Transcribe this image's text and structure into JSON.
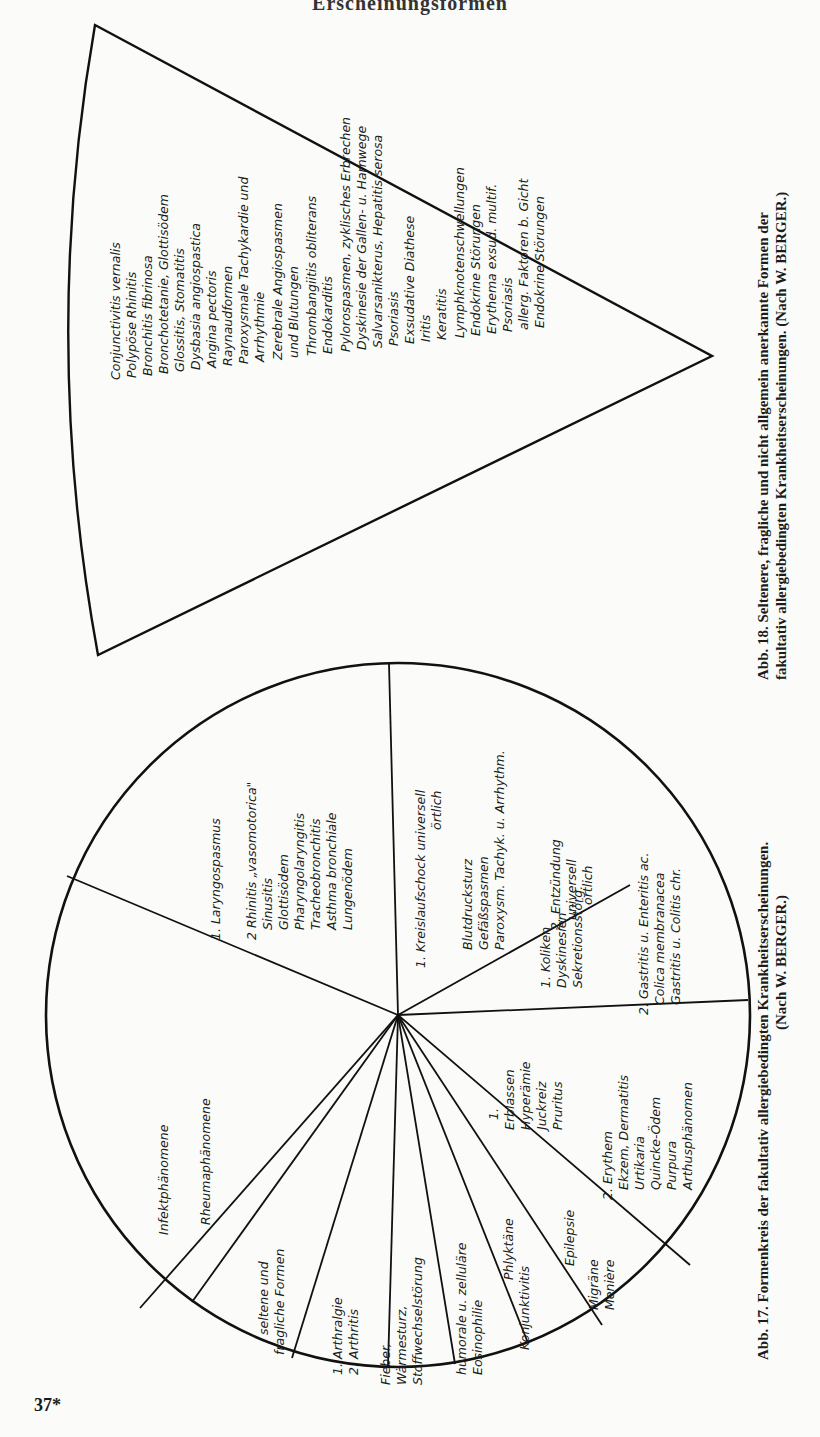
{
  "page": {
    "running_head": "Erscheinungsformen",
    "page_number": "37*"
  },
  "figure17": {
    "caption_line1": "Abb. 17.  Formenkreis der fakultativ allergiebedingten Krankheitserscheinungen.",
    "caption_line2": "(Nach W. BERGER.)",
    "sectors": [
      {
        "id": "respiratory",
        "lines": [
          "1. Laryngospasmus",
          "",
          "2  Rhinitis „vasomotorica\"",
          "Sinusitis",
          "Glottisödem",
          "Pharyngolaryngitis",
          "Tracheobronchitis",
          "Asthma bronchiale",
          "Lungenödem"
        ]
      },
      {
        "id": "circulatory",
        "lines": [
          "1. Kreislaufschock  universell",
          "örtlich",
          "",
          "Blutdrucksturz",
          "Gefäßspasmen",
          "Paroxysm. Tachyk. u. Arrhythm."
        ]
      },
      {
        "id": "inflammation",
        "lines": [
          "2. Entzündung",
          "universell",
          "örtlich"
        ]
      },
      {
        "id": "digestive-1",
        "lines": [
          "1. Koliken",
          "Dyskinesien",
          "Sekretionsstörg."
        ]
      },
      {
        "id": "digestive-2",
        "lines": [
          "2. Gastritis u. Enteritis ac.",
          "Colica membranacea",
          "Gastritis u. Colitis chr."
        ]
      },
      {
        "id": "skin-1",
        "lines": [
          "1.",
          "Erblassen",
          "Hyperämie",
          "Juckreiz",
          "Pruritus"
        ]
      },
      {
        "id": "skin-2",
        "lines": [
          "2. Erythem",
          "Ekzem, Dermatitis",
          "Urtikaria",
          "Quincke-Ödem",
          "Purpura",
          "Arthusphänomen"
        ]
      },
      {
        "id": "neuro",
        "lines": [
          "Migräne",
          "Menière"
        ]
      },
      {
        "id": "epilepsy",
        "lines": [
          "Epilepsie"
        ]
      },
      {
        "id": "eye",
        "lines": [
          "Phlyktäne",
          "Konjunktivitis"
        ]
      },
      {
        "id": "blood",
        "lines": [
          "humorale u. zelluläre",
          "Eosinophilie"
        ]
      },
      {
        "id": "metabolic",
        "lines": [
          "Fieber,",
          "Wärmesturz,",
          "Stoffwechselstörung"
        ]
      },
      {
        "id": "joints",
        "lines": [
          "1. Arthralgie",
          "2. Arthritis"
        ]
      },
      {
        "id": "rare",
        "lines": [
          "seltene und",
          "fragliche Formen"
        ]
      },
      {
        "id": "rheuma-infekt",
        "lines": [
          "Infektphänomene",
          "Rheumaphänomene"
        ]
      }
    ]
  },
  "figure18": {
    "caption_line1": "Abb. 18.  Seltenere, fragliche und nicht allgemein anerkannte Formen der",
    "caption_line2": "fakultativ allergiebedingten Krankheitserscheinungen. (Nach W. BERGER.)",
    "items": [
      "Conjunctivitis vernalis",
      "Polypöse Rhinitis",
      "Bronchitis fibrinosa",
      "Bronchotetanie, Glottisödem",
      "Glossitis, Stomatitis",
      "Dysbasia angiospastica",
      "Angina pectoris",
      "Raynaudformen",
      "Paroxysmale Tachykardie und",
      "Arrhythmie",
      "Zerebrale Angiospasmen",
      "und Blutungen",
      "Thrombangiitis obliterans",
      "Endokarditis",
      "Pylorospasmen, zyklisches Erbrechen",
      "Dyskinesie der Gallen- u. Harnwege",
      "Salvarsanikterus, Hepatitis serosa",
      "Psoriasis",
      "Exsudative Diathese",
      "Iritis",
      "Keratitis",
      "Lymphknotenschwellungen",
      "Endokrine Störungen",
      "Erythema exsud. multif.",
      "Psoriasis",
      "allerg. Faktoren b. Gicht",
      "Endokrine Störungen"
    ]
  }
}
